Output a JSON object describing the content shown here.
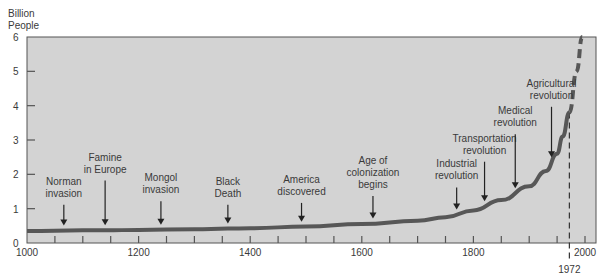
{
  "chart_data": {
    "type": "line",
    "title": "",
    "ylabel": "Billion People",
    "ylabel_lines": [
      "Billion",
      "People"
    ],
    "xlabel": "",
    "xlim": [
      1000,
      2010
    ],
    "ylim": [
      0,
      6
    ],
    "x_ticks": [
      1000,
      1200,
      1400,
      1600,
      1800,
      2000
    ],
    "x_minor_tick_step": 50,
    "y_ticks": [
      0,
      1,
      2,
      3,
      4,
      5,
      6
    ],
    "grid": false,
    "legend": null,
    "series": [
      {
        "name": "World population",
        "style": "solid",
        "x": [
          1000,
          1100,
          1140,
          1200,
          1300,
          1360,
          1400,
          1500,
          1600,
          1700,
          1750,
          1800,
          1850,
          1900,
          1930,
          1950,
          1960,
          1972
        ],
        "values": [
          0.35,
          0.37,
          0.37,
          0.38,
          0.4,
          0.42,
          0.43,
          0.48,
          0.55,
          0.65,
          0.75,
          0.95,
          1.25,
          1.65,
          2.1,
          2.6,
          3.1,
          3.8
        ]
      },
      {
        "name": "Projection",
        "style": "dashed",
        "x": [
          1972,
          1985,
          1995
        ],
        "values": [
          3.8,
          5.0,
          6.0
        ]
      }
    ],
    "reference_line": {
      "x": 1972,
      "label": "1972",
      "style": "dashed"
    },
    "annotations": [
      {
        "lines": [
          "Norman",
          "invasion"
        ],
        "x": 1066,
        "label_y": 1.7
      },
      {
        "lines": [
          "Famine",
          "in  Europe"
        ],
        "x": 1140,
        "label_y": 2.4
      },
      {
        "lines": [
          "Mongol",
          "invasion"
        ],
        "x": 1240,
        "label_y": 1.8
      },
      {
        "lines": [
          "Black",
          "Death"
        ],
        "x": 1360,
        "label_y": 1.7
      },
      {
        "lines": [
          "America",
          "discovered"
        ],
        "x": 1492,
        "label_y": 1.75
      },
      {
        "lines": [
          "Age  of",
          "colonization",
          "begins"
        ],
        "x": 1620,
        "label_y": 2.3
      },
      {
        "lines": [
          "Industrial",
          "revolution"
        ],
        "x": 1770,
        "label_y": 2.2
      },
      {
        "lines": [
          "Transportation",
          "revolution"
        ],
        "x": 1820,
        "label_y": 2.95
      },
      {
        "lines": [
          "Medical",
          "revolution"
        ],
        "x": 1875,
        "label_y": 3.75
      },
      {
        "lines": [
          "Agricultural",
          "revolution"
        ],
        "x": 1940,
        "label_y": 4.55
      }
    ]
  },
  "colors": {
    "plot_bg": "#d3d3d3",
    "curve": "#575757",
    "axis": "#555555",
    "text": "#3a3a3a"
  }
}
